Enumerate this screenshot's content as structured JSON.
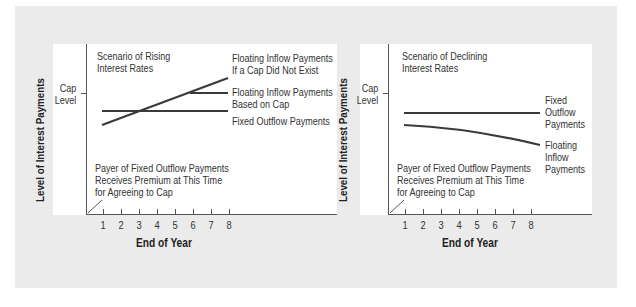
{
  "colors": {
    "background_gray": "#ebebeb",
    "panel": "#ffffff",
    "line": "#3a3a3a",
    "axis": "#555555",
    "text": "#333333"
  },
  "left_chart": {
    "y_axis_label": "Level of Interest Payments",
    "x_axis_label": "End of Year",
    "cap_label_line1": "Cap",
    "cap_label_line2": "Level",
    "scenario_line1": "Scenario of Rising",
    "scenario_line2": "Interest Rates",
    "annotations": {
      "floating_no_cap_line1": "Floating Inflow Payments",
      "floating_no_cap_line2": "If a Cap Did Not Exist",
      "floating_cap_line1": "Floating Inflow Payments",
      "floating_cap_line2": "Based on Cap",
      "fixed": "Fixed Outflow Payments"
    },
    "premium_line1": "Payer of Fixed Outflow Payments",
    "premium_line2": "Receives Premium at This Time",
    "premium_line3": "for Agreeing to Cap",
    "ticks": [
      "1",
      "2",
      "3",
      "4",
      "5",
      "6",
      "7",
      "8"
    ]
  },
  "right_chart": {
    "y_axis_label": "Level of Interest Payments",
    "x_axis_label": "End of Year",
    "cap_label_line1": "Cap",
    "cap_label_line2": "Level",
    "scenario_line1": "Scenario of Declining",
    "scenario_line2": "Interest Rates",
    "annotations": {
      "fixed_line1": "Fixed",
      "fixed_line2": "Outflow",
      "fixed_line3": "Payments",
      "floating_line1": "Floating",
      "floating_line2": "Inflow",
      "floating_line3": "Payments"
    },
    "premium_line1": "Payer of Fixed Outflow Payments",
    "premium_line2": "Receives Premium at This Time",
    "premium_line3": "for Agreeing to Cap",
    "ticks": [
      "1",
      "2",
      "3",
      "4",
      "5",
      "6",
      "7",
      "8"
    ]
  }
}
